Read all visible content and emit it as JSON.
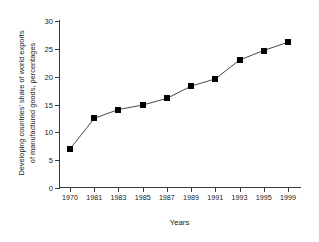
{
  "chart_data": {
    "type": "line",
    "title": "",
    "subtitle": "",
    "xlabel": "Years",
    "ylabel": "Developing countries' share of world exports of manufactured goods, percentages",
    "ylabel_line1": "Developing countries' share of world exports",
    "ylabel_line2": "of manufactured goods, percentages",
    "categories": [
      "1970",
      "1981",
      "1983",
      "1985",
      "1987",
      "1989",
      "1991",
      "1993",
      "1995",
      "1999"
    ],
    "x": [
      1970,
      1981,
      1983,
      1985,
      1987,
      1989,
      1991,
      1993,
      1995,
      1999
    ],
    "values": [
      7.0,
      12.5,
      14.1,
      14.9,
      16.1,
      18.3,
      19.6,
      23.0,
      24.7,
      26.2
    ],
    "ylim": [
      0,
      30
    ],
    "yticks": [
      "0",
      "5",
      "10",
      "15",
      "20",
      "25",
      "30"
    ],
    "ytick_values": [
      0,
      5,
      10,
      15,
      20,
      25,
      30
    ],
    "xtick_labels": [
      "1970",
      "1981",
      "1983",
      "1985",
      "1987",
      "1989",
      "1991",
      "1993",
      "1995",
      "1999"
    ],
    "grid": false,
    "legend": false,
    "legend_position": "none",
    "marker": "filled-square",
    "marker_color": "#000000",
    "line_color": "#333333",
    "background_color": "#ffffff",
    "axis_color": "#3b3b3b"
  }
}
